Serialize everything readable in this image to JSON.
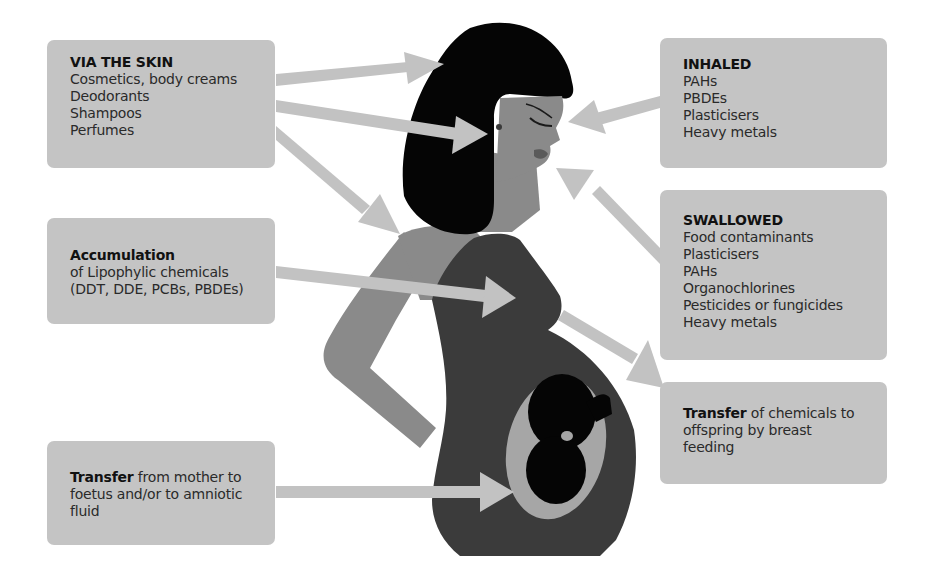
{
  "diagram": {
    "colors": {
      "box_fill": "#c4c4c4",
      "arrow_fill": "#c2c2c2",
      "hair": "#050505",
      "skin": "#8a8a8a",
      "dress": "#3b3b3b",
      "womb": "#a6a6a6",
      "foetus": "#050505",
      "text": "#2a2a2a"
    },
    "boxes": {
      "skin": {
        "title": "VIA THE SKIN",
        "items": [
          "Cosmetics, body creams",
          "Deodorants",
          "Shampoos",
          "Perfumes"
        ]
      },
      "accumulation": {
        "title": "Accumulation",
        "lines": [
          "of Lipophylic chemicals",
          "(DDT, DDE, PCBs, PBDEs)"
        ]
      },
      "foetus_transfer": {
        "bold": "Transfer",
        "text": " from mother to foetus and/or to amniotic fluid"
      },
      "inhaled": {
        "title": "INHALED",
        "items": [
          "PAHs",
          "PBDEs",
          "Plasticisers",
          "Heavy metals"
        ]
      },
      "swallowed": {
        "title": "SWALLOWED",
        "items": [
          "Food contaminants",
          "Plasticisers",
          "PAHs",
          "Organochlorines",
          "Pesticides or fungicides",
          "Heavy metals"
        ]
      },
      "breast_feeding": {
        "bold": "Transfer",
        "text": " of chemicals to offspring by breast feeding"
      }
    },
    "arrows": [
      {
        "from": "skin",
        "to": "head-hair",
        "direction": "right"
      },
      {
        "from": "skin",
        "to": "ear",
        "direction": "right-down"
      },
      {
        "from": "skin",
        "to": "shoulder",
        "direction": "down-right"
      },
      {
        "from": "accumulation",
        "to": "breast",
        "direction": "right"
      },
      {
        "from": "foetus_transfer",
        "to": "womb",
        "direction": "right"
      },
      {
        "from": "inhaled",
        "to": "nose",
        "direction": "left"
      },
      {
        "from": "swallowed",
        "to": "mouth",
        "direction": "up-left"
      },
      {
        "from": "breast",
        "to": "breast_feeding",
        "direction": "down-right"
      }
    ]
  }
}
